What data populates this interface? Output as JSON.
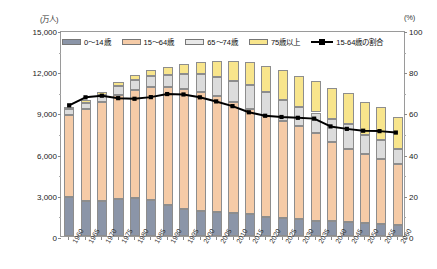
{
  "chart_data": {
    "type": "bar",
    "subtype": "stacked-bar-with-line",
    "title": "",
    "xlabel": "",
    "ylabel": "万人",
    "y2label": "%",
    "unit_left": "(万人)",
    "unit_right": "(%)",
    "ylim": [
      0,
      15000
    ],
    "y2lim": [
      0,
      100
    ],
    "yticks": [
      "0",
      "3,000",
      "6,000",
      "9,000",
      "12,000",
      "15,000"
    ],
    "ytick_values": [
      0,
      3000,
      6000,
      9000,
      12000,
      15000
    ],
    "y2ticks": [
      "0",
      "20",
      "40",
      "60",
      "80",
      "100"
    ],
    "y2tick_values": [
      0,
      20,
      40,
      60,
      80,
      100
    ],
    "grid": false,
    "legend_position": "top-inside",
    "categories": [
      "1960",
      "1965",
      "1970",
      "1975",
      "1980",
      "1985",
      "1990",
      "1995",
      "2000",
      "2005",
      "2010",
      "2015",
      "2020",
      "2025",
      "2030",
      "2035",
      "2040",
      "2045",
      "2050",
      "2055",
      "2060"
    ],
    "series": [
      {
        "name": "0～14歳",
        "color": "#8b95a8",
        "values": [
          2843,
          2553,
          2515,
          2722,
          2751,
          2603,
          2249,
          2001,
          1847,
          1752,
          1684,
          1583,
          1407,
          1324,
          1204,
          1129,
          1073,
          1012,
          939,
          872,
          791
        ]
      },
      {
        "name": "15～64歳",
        "color": "#f5cba7",
        "values": [
          6000,
          6693,
          7212,
          7581,
          7883,
          8251,
          8590,
          8717,
          8622,
          8409,
          8103,
          7682,
          7341,
          7085,
          6773,
          6343,
          5787,
          5353,
          5001,
          4706,
          4418
        ]
      },
      {
        "name": "65～74歳",
        "color": "#dcdcdc",
        "values": [
          376,
          443,
          516,
          602,
          699,
          776,
          892,
          1109,
          1301,
          1407,
          1517,
          1749,
          1747,
          1497,
          1428,
          1522,
          1681,
          1797,
          1424,
          1383,
          1128
        ]
      },
      {
        "name": "75歳以上",
        "color": "#f8e58c",
        "values": [
          163,
          189,
          221,
          284,
          366,
          471,
          597,
          717,
          900,
          1164,
          1419,
          1646,
          1872,
          2180,
          2278,
          2260,
          2239,
          2277,
          2385,
          2401,
          2336
        ]
      }
    ],
    "line_series": {
      "name": "15-64歳の割合",
      "color": "#000000",
      "axis": "right",
      "unit": "%",
      "values": [
        64.2,
        68.1,
        68.9,
        67.7,
        67.4,
        68.2,
        69.7,
        69.5,
        68.1,
        66.1,
        63.8,
        60.8,
        59.1,
        58.5,
        58.1,
        57.7,
        53.9,
        52.7,
        51.8,
        51.6,
        50.9
      ]
    }
  },
  "legend": {
    "items": [
      {
        "label": "0～14歳",
        "type": "swatch",
        "color": "#8b95a8"
      },
      {
        "label": "15～64歳",
        "type": "swatch",
        "color": "#f5cba7"
      },
      {
        "label": "65～74歳",
        "type": "swatch",
        "color": "#e8e8e8"
      },
      {
        "label": "75歳以上",
        "type": "swatch",
        "color": "#f8e58c"
      },
      {
        "label": "15-64歳の割合",
        "type": "line",
        "color": "#000000"
      }
    ]
  }
}
